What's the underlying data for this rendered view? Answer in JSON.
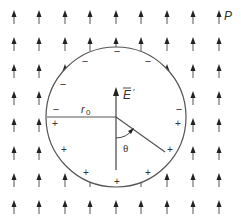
{
  "diagram": {
    "labels": {
      "polarization": "P",
      "field": "E",
      "field_prime": "′",
      "radius": "r",
      "radius_sub": "0",
      "angle": "θ"
    },
    "charges": {
      "minus": "−",
      "plus": "+"
    },
    "colors": {
      "line": "#555555",
      "arrow": "#222222",
      "text": "#333333"
    },
    "grid": {
      "columns": [
        14,
        39,
        65,
        90,
        116,
        141,
        167,
        193,
        219
      ],
      "rows": [
        16,
        43,
        70,
        97,
        124,
        152,
        179,
        206
      ]
    },
    "circle": {
      "cx": 116,
      "cy": 117,
      "r": 70
    }
  }
}
